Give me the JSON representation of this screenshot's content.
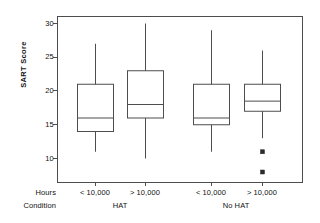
{
  "chart_data": {
    "type": "box",
    "title": "",
    "xlabel": "",
    "ylabel": "SART Score",
    "ylim": [
      7,
      31
    ],
    "yticks": [
      10,
      15,
      20,
      25,
      30
    ],
    "ytick_labels": [
      "10",
      "15",
      "20",
      "25",
      "30"
    ],
    "grid": false,
    "legend": "none",
    "group_axis_rows": [
      "Hours",
      "Condition"
    ],
    "groups": [
      {
        "condition": "HAT",
        "boxes": [
          "< 10,000",
          "> 10,000"
        ]
      },
      {
        "condition": "No HAT",
        "boxes": [
          "< 10,000",
          "> 10,000"
        ]
      }
    ],
    "boxes": [
      {
        "label": "< 10,000",
        "condition": "HAT",
        "whisker_low": 11,
        "q1": 14,
        "median": 16,
        "q3": 21,
        "whisker_high": 27,
        "outliers": []
      },
      {
        "label": "> 10,000",
        "condition": "HAT",
        "whisker_low": 10,
        "q1": 16,
        "median": 18,
        "q3": 23,
        "whisker_high": 30,
        "outliers": []
      },
      {
        "label": "< 10,000",
        "condition": "No HAT",
        "whisker_low": 11,
        "q1": 15,
        "median": 16,
        "q3": 21,
        "whisker_high": 29,
        "outliers": []
      },
      {
        "label": "> 10,000",
        "condition": "No HAT",
        "whisker_low": 13,
        "q1": 17,
        "median": 18.5,
        "q3": 21,
        "whisker_high": 26,
        "outliers": [
          11,
          8
        ]
      }
    ],
    "colors": {
      "frame": "#4d4d4d",
      "box_stroke": "#4d4d4d",
      "whisker": "#4d4d4d",
      "median": "#4d4d4d",
      "outlier": "#2b2b2b",
      "background": "#ffffff",
      "text": "#111111"
    }
  },
  "axis_labels": {
    "hours_row": "Hours",
    "condition_row": "Condition"
  }
}
